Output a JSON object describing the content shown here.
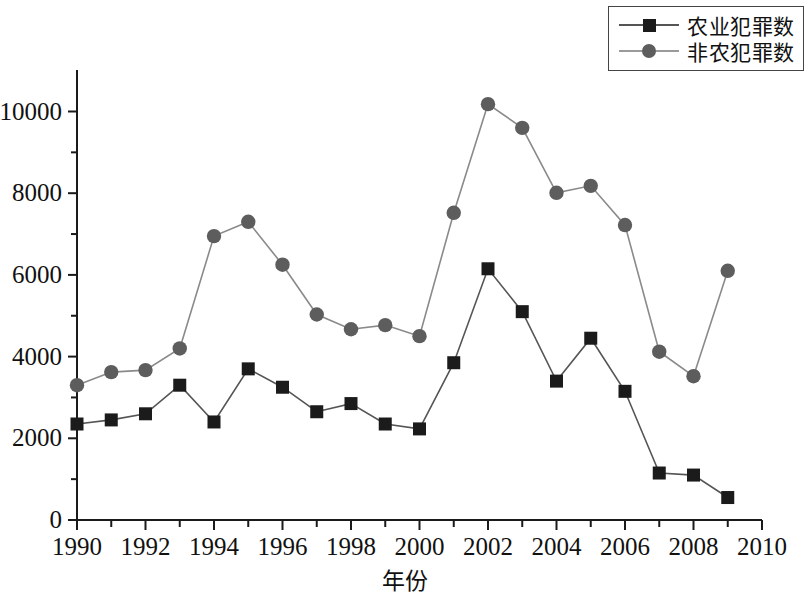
{
  "chart_data": {
    "type": "line",
    "title": "",
    "xlabel": "年份",
    "ylabel": "",
    "x": [
      1990,
      1991,
      1992,
      1993,
      1994,
      1995,
      1996,
      1997,
      1998,
      1999,
      2000,
      2001,
      2002,
      2003,
      2004,
      2005,
      2006,
      2007,
      2008,
      2009
    ],
    "xlim": [
      1990,
      2010
    ],
    "ylim": [
      0,
      10800
    ],
    "xticks": [
      1990,
      1992,
      1994,
      1996,
      1998,
      2000,
      2002,
      2004,
      2006,
      2008,
      2010
    ],
    "xtick_labels": [
      "1990",
      "1992",
      "1994",
      "1996",
      "1998",
      "2000",
      "2002",
      "2004",
      "2006",
      "2008",
      "2010"
    ],
    "xticks_minor": [
      1991,
      1993,
      1995,
      1997,
      1999,
      2001,
      2003,
      2005,
      2007,
      2009
    ],
    "yticks": [
      0,
      2000,
      4000,
      6000,
      8000,
      10000
    ],
    "ytick_labels": [
      "0",
      "2000",
      "4000",
      "6000",
      "8000",
      "10000"
    ],
    "yticks_minor": [
      1000,
      3000,
      5000,
      7000,
      9000
    ],
    "grid": false,
    "legend_position": "top-right",
    "series": [
      {
        "name": "农业犯罪数",
        "marker": "square",
        "color": "#1b1b1b",
        "line_color": "#555555",
        "values": [
          2350,
          2450,
          2600,
          3300,
          2400,
          3700,
          3250,
          2650,
          2850,
          2350,
          2230,
          3850,
          6150,
          5100,
          3400,
          4450,
          3150,
          1150,
          1100,
          550
        ]
      },
      {
        "name": "非农犯罪数",
        "marker": "circle",
        "color": "#5d5d5d",
        "line_color": "#8a8a8a",
        "values": [
          3300,
          3620,
          3670,
          4200,
          6950,
          7300,
          6250,
          5030,
          4670,
          4770,
          4500,
          7520,
          10180,
          9600,
          8010,
          8180,
          7220,
          4120,
          3520,
          6100
        ]
      }
    ]
  },
  "legend": {
    "items": [
      {
        "label": "农业犯罪数",
        "marker": "square-marker"
      },
      {
        "label": "非农犯罪数",
        "marker": "circle-marker"
      }
    ]
  }
}
